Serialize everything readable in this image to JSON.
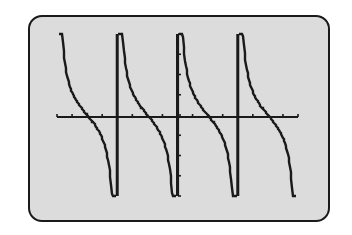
{
  "chart_data": {
    "type": "line",
    "title": "",
    "function": "y = cot(x)",
    "xlabel": "",
    "ylabel": "",
    "grid": false,
    "legend": null,
    "xlim": [
      -6.28,
      6.28
    ],
    "ylim": [
      -3.5,
      3.5
    ],
    "x_tick_count_visible": 16,
    "y_tick_count_visible": 8,
    "asymptotes_x": [
      -3.1416,
      0,
      3.1416
    ],
    "branches": [
      {
        "x_start": -6.2,
        "x_end": -3.2
      },
      {
        "x_start": -3.1,
        "x_end": -0.06
      },
      {
        "x_start": 0.06,
        "x_end": 3.1
      },
      {
        "x_start": 3.2,
        "x_end": 6.2
      }
    ],
    "colors": {
      "screen_bg": "#dcdcdc",
      "ink": "#1a1a1a",
      "page_bg": "#ffffff"
    }
  },
  "screen": {
    "label": "graphing calculator display"
  }
}
